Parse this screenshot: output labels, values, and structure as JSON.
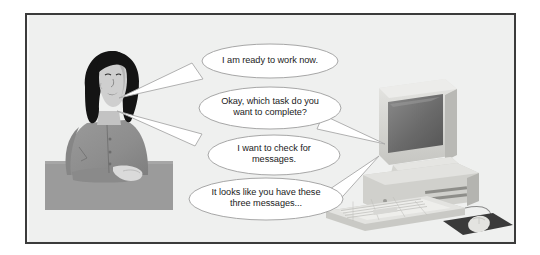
{
  "illustration": {
    "title": "Voice interaction with a desktop computer",
    "frame": {
      "border_color": "#3b3b3b",
      "background_color": "#eeeeee"
    },
    "figures": {
      "person": {
        "name": "seated woman at desk",
        "hair_color": "#151515",
        "skin_color": "#cfcfcf",
        "clothing_color": "#8f8f8f",
        "desk_color": "#9a9a9a"
      },
      "computer": {
        "name": "desktop computer with monitor, tower, keyboard and mouse",
        "case_color": "#d8d8d6",
        "screen_color": "#6e6e6e",
        "mousepad_color": "#3a3a3a"
      }
    },
    "speech_bubbles": [
      {
        "id": "bubble-1",
        "speaker": "person",
        "tail_direction": "left",
        "text": "I am ready to work now."
      },
      {
        "id": "bubble-2",
        "speaker": "computer",
        "tail_direction": "right",
        "text": "Okay, which task do you\nwant to complete?"
      },
      {
        "id": "bubble-3",
        "speaker": "person",
        "tail_direction": "left",
        "text": "I want to check for\nmessages."
      },
      {
        "id": "bubble-4",
        "speaker": "computer",
        "tail_direction": "right",
        "text": "It looks like you have these\nthree messages..."
      }
    ]
  }
}
